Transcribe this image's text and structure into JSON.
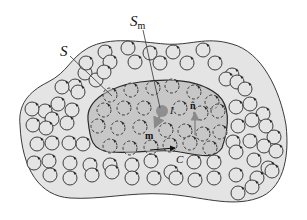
{
  "figure": {
    "colors": {
      "background": "#ffffff",
      "outer_fill": "#e4e4e4",
      "outer_stroke": "#3a3a3a",
      "inner_fill": "#bdbdbd",
      "inner_stroke": "#2a2a2a",
      "loop_stroke": "#2b2b2b",
      "loop_fill_inner": "#c8c8c8",
      "loop_fill_outer": "#e4e4e4",
      "dot_fill": "#8f8f8f",
      "arrow_gray": "#8a8a8a"
    },
    "labels": {
      "S": "S",
      "Sm_main": "S",
      "Sm_sub": "m",
      "n": "n̂",
      "I": "I",
      "m": "m",
      "C": "C"
    },
    "outer_loops": [
      [
        45,
        111
      ],
      [
        58,
        104
      ],
      [
        75,
        86
      ],
      [
        85,
        73
      ],
      [
        105,
        52
      ],
      [
        128,
        48
      ],
      [
        150,
        53
      ],
      [
        173,
        52
      ],
      [
        203,
        50
      ],
      [
        86,
        63
      ],
      [
        110,
        62
      ],
      [
        135,
        62
      ],
      [
        160,
        63
      ],
      [
        187,
        63
      ],
      [
        215,
        63
      ],
      [
        232,
        75
      ],
      [
        62,
        87
      ],
      [
        78,
        92
      ],
      [
        96,
        80
      ],
      [
        104,
        72
      ],
      [
        226,
        79
      ],
      [
        237,
        82
      ],
      [
        245,
        89
      ],
      [
        32,
        109
      ],
      [
        52,
        119
      ],
      [
        67,
        123
      ],
      [
        72,
        110
      ],
      [
        236,
        107
      ],
      [
        250,
        104
      ],
      [
        263,
        114
      ],
      [
        266,
        126
      ],
      [
        33,
        125
      ],
      [
        46,
        128
      ],
      [
        238,
        126
      ],
      [
        252,
        120
      ],
      [
        274,
        137
      ],
      [
        37,
        144
      ],
      [
        52,
        143
      ],
      [
        69,
        143
      ],
      [
        83,
        144
      ],
      [
        233,
        142
      ],
      [
        250,
        141
      ],
      [
        264,
        146
      ],
      [
        276,
        151
      ],
      [
        34,
        163
      ],
      [
        49,
        161
      ],
      [
        70,
        163
      ],
      [
        90,
        165
      ],
      [
        110,
        165
      ],
      [
        132,
        165
      ],
      [
        151,
        161
      ],
      [
        171,
        172
      ],
      [
        194,
        162
      ],
      [
        214,
        162
      ],
      [
        236,
        152
      ],
      [
        254,
        160
      ],
      [
        268,
        168
      ],
      [
        50,
        175
      ],
      [
        70,
        178
      ],
      [
        92,
        175
      ],
      [
        112,
        172
      ],
      [
        132,
        178
      ],
      [
        154,
        178
      ],
      [
        176,
        178
      ],
      [
        195,
        180
      ],
      [
        214,
        178
      ],
      [
        236,
        175
      ],
      [
        257,
        178
      ],
      [
        272,
        171
      ],
      [
        238,
        193
      ],
      [
        252,
        187
      ]
    ],
    "inner_loops": [
      [
        110,
        95
      ],
      [
        131,
        90
      ],
      [
        153,
        88
      ],
      [
        172,
        86
      ],
      [
        194,
        92
      ],
      [
        212,
        102
      ],
      [
        104,
        110
      ],
      [
        124,
        108
      ],
      [
        144,
        108
      ],
      [
        180,
        108
      ],
      [
        201,
        113
      ],
      [
        218,
        111
      ],
      [
        98,
        126
      ],
      [
        118,
        128
      ],
      [
        140,
        127
      ],
      [
        166,
        130
      ],
      [
        185,
        131
      ],
      [
        203,
        134
      ],
      [
        220,
        132
      ],
      [
        110,
        146
      ],
      [
        130,
        148
      ],
      [
        151,
        147
      ],
      [
        170,
        145
      ],
      [
        190,
        143
      ],
      [
        210,
        148
      ]
    ],
    "dot": [
      162,
      111
    ],
    "outer_boundary_path": "M 20,125 C 18,105 28,92 48,82 C 68,72 70,58 88,48 C 110,36 140,42 165,44 C 190,46 205,36 232,44 C 262,52 280,90 286,125 C 290,160 282,190 258,198 C 230,208 200,196 165,194 C 130,192 100,200 70,198 C 40,196 22,170 20,125 Z",
    "inner_boundary_path": "M 88,120 C 86,100 110,86 140,82 C 170,78 200,80 218,95 C 232,108 228,130 222,148 C 214,160 198,155 180,152 C 160,148 140,154 110,152 C 92,150 90,140 88,120 Z"
  }
}
